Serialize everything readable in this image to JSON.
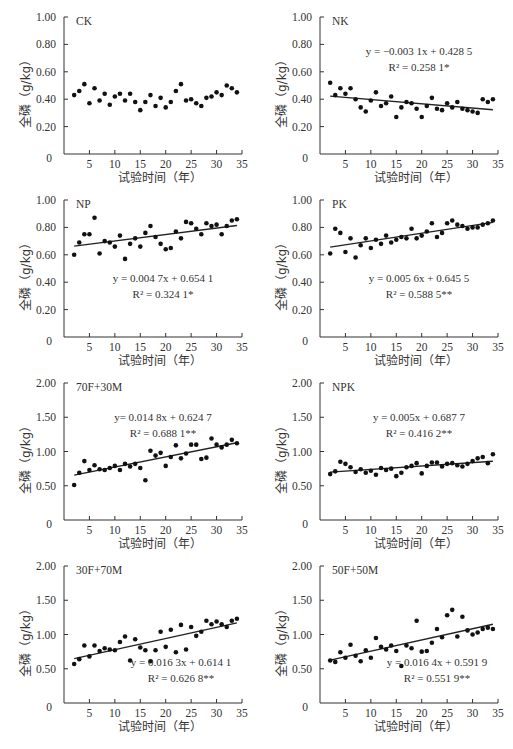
{
  "figure": {
    "xlabel": "试验时间（年）",
    "ylabel": "全磷（g/kg）"
  },
  "chart_data": [
    {
      "type": "scatter",
      "panel": "CK",
      "title": "CK",
      "xlabel": "试验时间（年）",
      "ylabel": "全磷（g/kg）",
      "xlim": [
        0,
        35
      ],
      "ylim": [
        0,
        1.0
      ],
      "xticks": [
        5,
        10,
        15,
        20,
        25,
        30,
        35
      ],
      "yticks": [
        "0",
        "0.20",
        "0.40",
        "0.60",
        "0.80",
        "1.00"
      ],
      "x": [
        2,
        3,
        4,
        5,
        6,
        7,
        8,
        9,
        10,
        11,
        12,
        13,
        14,
        15,
        16,
        17,
        18,
        19,
        20,
        21,
        22,
        23,
        24,
        25,
        26,
        27,
        28,
        29,
        30,
        31,
        32,
        33,
        34
      ],
      "y": [
        0.43,
        0.46,
        0.51,
        0.37,
        0.48,
        0.39,
        0.44,
        0.36,
        0.42,
        0.44,
        0.39,
        0.44,
        0.38,
        0.32,
        0.38,
        0.43,
        0.35,
        0.41,
        0.34,
        0.38,
        0.46,
        0.51,
        0.39,
        0.4,
        0.37,
        0.35,
        0.41,
        0.42,
        0.45,
        0.43,
        0.5,
        0.48,
        0.45
      ],
      "trendline": null,
      "equation": "",
      "r2": ""
    },
    {
      "type": "scatter",
      "panel": "NK",
      "title": "NK",
      "xlabel": "试验时间（年）",
      "ylabel": "全磷（g/kg）",
      "xlim": [
        0,
        35
      ],
      "ylim": [
        0,
        1.0
      ],
      "xticks": [
        5,
        10,
        15,
        20,
        25,
        30,
        35
      ],
      "yticks": [
        "0",
        "0.20",
        "0.40",
        "0.60",
        "0.80",
        "1.00"
      ],
      "x": [
        2,
        3,
        4,
        5,
        6,
        7,
        8,
        9,
        10,
        11,
        12,
        13,
        14,
        15,
        16,
        17,
        18,
        19,
        20,
        21,
        22,
        23,
        24,
        25,
        26,
        27,
        28,
        29,
        30,
        31,
        32,
        33,
        34
      ],
      "y": [
        0.52,
        0.43,
        0.48,
        0.44,
        0.48,
        0.4,
        0.34,
        0.31,
        0.39,
        0.45,
        0.35,
        0.37,
        0.42,
        0.27,
        0.34,
        0.38,
        0.37,
        0.33,
        0.27,
        0.35,
        0.41,
        0.33,
        0.32,
        0.37,
        0.34,
        0.38,
        0.33,
        0.32,
        0.31,
        0.3,
        0.4,
        0.38,
        0.4
      ],
      "trendline": {
        "slope": -0.0031,
        "intercept": 0.4285,
        "x_range": [
          2,
          34
        ]
      },
      "equation": "y = −0.003 1x + 0.428 5",
      "r2": "R² = 0.258 1*"
    },
    {
      "type": "scatter",
      "panel": "NP",
      "title": "NP",
      "xlabel": "试验时间（年）",
      "ylabel": "全磷（g/kg）",
      "xlim": [
        0,
        35
      ],
      "ylim": [
        0,
        1.0
      ],
      "xticks": [
        5,
        10,
        15,
        20,
        25,
        30,
        35
      ],
      "yticks": [
        "0",
        "0.20",
        "0.40",
        "0.60",
        "0.80",
        "1.00"
      ],
      "x": [
        2,
        3,
        4,
        5,
        6,
        7,
        8,
        9,
        10,
        11,
        12,
        13,
        14,
        15,
        16,
        17,
        18,
        19,
        20,
        21,
        22,
        23,
        24,
        25,
        26,
        27,
        28,
        29,
        30,
        31,
        32,
        33,
        34
      ],
      "y": [
        0.6,
        0.69,
        0.75,
        0.75,
        0.87,
        0.61,
        0.7,
        0.69,
        0.66,
        0.74,
        0.57,
        0.68,
        0.72,
        0.66,
        0.76,
        0.81,
        0.73,
        0.68,
        0.64,
        0.65,
        0.77,
        0.72,
        0.84,
        0.83,
        0.79,
        0.75,
        0.83,
        0.81,
        0.82,
        0.75,
        0.81,
        0.85,
        0.86
      ],
      "trendline": {
        "slope": 0.0047,
        "intercept": 0.6541,
        "x_range": [
          2,
          34
        ]
      },
      "equation": "y = 0.004 7x + 0.654 1",
      "r2": "R² = 0.324 1*"
    },
    {
      "type": "scatter",
      "panel": "PK",
      "title": "PK",
      "xlabel": "试验时间（年）",
      "ylabel": "全磷（g/kg）",
      "xlim": [
        0,
        35
      ],
      "ylim": [
        0,
        1.0
      ],
      "xticks": [
        5,
        10,
        15,
        20,
        25,
        30,
        35
      ],
      "yticks": [
        "0",
        "0.20",
        "0.40",
        "0.60",
        "0.80",
        "1.00"
      ],
      "x": [
        2,
        3,
        4,
        5,
        6,
        7,
        8,
        9,
        10,
        11,
        12,
        13,
        14,
        15,
        16,
        17,
        18,
        19,
        20,
        21,
        22,
        23,
        24,
        25,
        26,
        27,
        28,
        29,
        30,
        31,
        32,
        33,
        34
      ],
      "y": [
        0.61,
        0.79,
        0.76,
        0.62,
        0.72,
        0.58,
        0.67,
        0.72,
        0.65,
        0.71,
        0.68,
        0.74,
        0.69,
        0.71,
        0.73,
        0.72,
        0.79,
        0.72,
        0.74,
        0.77,
        0.83,
        0.73,
        0.76,
        0.83,
        0.85,
        0.82,
        0.81,
        0.79,
        0.8,
        0.8,
        0.82,
        0.83,
        0.85
      ],
      "trendline": {
        "slope": 0.0056,
        "intercept": 0.6455,
        "x_range": [
          2,
          34
        ]
      },
      "equation": "y = 0.005 6x + 0.645 5",
      "r2": "R² = 0.588 5**"
    },
    {
      "type": "scatter",
      "panel": "70F+30M",
      "title": "70F+30M",
      "xlabel": "试验时间（年）",
      "ylabel": "全磷（g/kg）",
      "xlim": [
        0,
        35
      ],
      "ylim": [
        0,
        2.0
      ],
      "xticks": [
        5,
        10,
        15,
        20,
        25,
        30,
        35
      ],
      "yticks": [
        "0",
        "0.50",
        "1.00",
        "1.50",
        "2.00"
      ],
      "x": [
        2,
        3,
        4,
        5,
        6,
        7,
        8,
        9,
        10,
        11,
        12,
        13,
        14,
        15,
        16,
        17,
        18,
        19,
        20,
        21,
        22,
        23,
        24,
        25,
        26,
        27,
        28,
        29,
        30,
        31,
        32,
        33,
        34
      ],
      "y": [
        0.51,
        0.69,
        0.86,
        0.73,
        0.8,
        0.74,
        0.73,
        0.76,
        0.79,
        0.73,
        0.82,
        0.78,
        0.82,
        0.76,
        0.58,
        1.01,
        0.94,
        0.98,
        0.79,
        0.92,
        1.09,
        0.9,
        0.97,
        1.1,
        1.1,
        0.89,
        0.91,
        1.19,
        1.1,
        1.06,
        1.1,
        1.17,
        1.12
      ],
      "trendline": {
        "slope": 0.0148,
        "intercept": 0.6247,
        "x_range": [
          2,
          34
        ]
      },
      "equation": "y= 0.014 8x + 0.624 7",
      "r2": "R² = 0.688 1**"
    },
    {
      "type": "scatter",
      "panel": "NPK",
      "title": "NPK",
      "xlabel": "试验时间（年）",
      "ylabel": "全磷（g/kg）",
      "xlim": [
        0,
        35
      ],
      "ylim": [
        0,
        2.0
      ],
      "xticks": [
        5,
        10,
        15,
        20,
        25,
        30,
        35
      ],
      "yticks": [
        "0",
        "0.50",
        "1.00",
        "1.50",
        "2.00"
      ],
      "x": [
        2,
        3,
        4,
        5,
        6,
        7,
        8,
        9,
        10,
        11,
        12,
        13,
        14,
        15,
        16,
        17,
        18,
        19,
        20,
        21,
        22,
        23,
        24,
        25,
        26,
        27,
        28,
        29,
        30,
        31,
        32,
        33,
        34
      ],
      "y": [
        0.67,
        0.71,
        0.85,
        0.82,
        0.77,
        0.7,
        0.74,
        0.69,
        0.72,
        0.66,
        0.76,
        0.73,
        0.75,
        0.64,
        0.69,
        0.77,
        0.79,
        0.83,
        0.68,
        0.79,
        0.84,
        0.84,
        0.78,
        0.82,
        0.83,
        0.8,
        0.78,
        0.82,
        0.86,
        0.9,
        0.92,
        0.83,
        0.96
      ],
      "trendline": {
        "slope": 0.005,
        "intercept": 0.6877,
        "x_range": [
          2,
          34
        ]
      },
      "equation": "y = 0.005x + 0.687 7",
      "r2": "R² = 0.416 2**"
    },
    {
      "type": "scatter",
      "panel": "30F+70M",
      "title": "30F+70M",
      "xlabel": "试验时间（年）",
      "ylabel": "全磷（g/kg）",
      "xlim": [
        0,
        35
      ],
      "ylim": [
        0,
        2.0
      ],
      "xticks": [
        5,
        10,
        15,
        20,
        25,
        30,
        35
      ],
      "yticks": [
        "0",
        "0.50",
        "1.00",
        "1.50",
        "2.00"
      ],
      "x": [
        2,
        3,
        4,
        5,
        6,
        7,
        8,
        9,
        10,
        11,
        12,
        13,
        14,
        15,
        16,
        17,
        18,
        19,
        20,
        21,
        22,
        23,
        24,
        25,
        26,
        27,
        28,
        29,
        30,
        31,
        32,
        33,
        34
      ],
      "y": [
        0.57,
        0.64,
        0.84,
        0.68,
        0.84,
        0.76,
        0.8,
        0.78,
        0.77,
        0.89,
        0.97,
        0.62,
        0.93,
        0.81,
        0.77,
        0.61,
        0.77,
        1.04,
        0.82,
        1.07,
        0.74,
        1.14,
        0.78,
        1.11,
        0.98,
        1.04,
        1.2,
        1.15,
        1.19,
        1.15,
        1.11,
        1.2,
        1.23
      ],
      "trendline": {
        "slope": 0.0163,
        "intercept": 0.6141,
        "x_range": [
          2,
          34
        ]
      },
      "equation": "y = 0.016 3x + 0.614 1",
      "r2": "R² = 0.626 8**"
    },
    {
      "type": "scatter",
      "panel": "50F+50M",
      "title": "50F+50M",
      "xlabel": "试验时间（年）",
      "ylabel": "全磷（g/kg）",
      "xlim": [
        0,
        35
      ],
      "ylim": [
        0,
        2.0
      ],
      "xticks": [
        5,
        10,
        15,
        20,
        25,
        30,
        35
      ],
      "yticks": [
        "0",
        "0.50",
        "1.00",
        "1.50",
        "2.00"
      ],
      "x": [
        2,
        3,
        4,
        5,
        6,
        7,
        8,
        9,
        10,
        11,
        12,
        13,
        14,
        15,
        16,
        17,
        18,
        19,
        20,
        21,
        22,
        23,
        24,
        25,
        26,
        27,
        28,
        29,
        30,
        31,
        32,
        33,
        34
      ],
      "y": [
        0.62,
        0.6,
        0.74,
        0.66,
        0.85,
        0.69,
        0.61,
        0.77,
        0.66,
        0.95,
        0.82,
        0.78,
        0.84,
        0.76,
        0.54,
        0.84,
        0.8,
        1.2,
        0.75,
        0.76,
        0.88,
        1.08,
        0.96,
        1.28,
        1.36,
        0.97,
        1.26,
        1.06,
        1.0,
        1.03,
        1.08,
        1.1,
        1.08
      ],
      "trendline": {
        "slope": 0.0164,
        "intercept": 0.5919,
        "x_range": [
          2,
          34
        ]
      },
      "equation": "y = 0.016 4x + 0.591 9",
      "r2": "R² = 0.551 9**"
    }
  ],
  "layout": {
    "panels": [
      {
        "left": 0,
        "top": 0,
        "title_pos": "top-left",
        "eq_pos": null
      },
      {
        "left": 256,
        "top": 0,
        "title_pos": "top-left",
        "eq_pos": "upper"
      },
      {
        "left": 0,
        "top": 183,
        "title_pos": "top-left",
        "eq_pos": "middle"
      },
      {
        "left": 256,
        "top": 183,
        "title_pos": "top-left",
        "eq_pos": "middle"
      },
      {
        "left": 0,
        "top": 366,
        "title_pos": "top-left",
        "eq_pos": "upper"
      },
      {
        "left": 256,
        "top": 366,
        "title_pos": "top-left",
        "eq_pos": "upper"
      },
      {
        "left": 0,
        "top": 549,
        "title_pos": "top-left",
        "eq_pos": "lower"
      },
      {
        "left": 256,
        "top": 549,
        "title_pos": "top-left",
        "eq_pos": "lower"
      }
    ]
  },
  "colors": {
    "axis": "#333333",
    "point": "#111111",
    "line": "#222222",
    "text": "#333333"
  }
}
